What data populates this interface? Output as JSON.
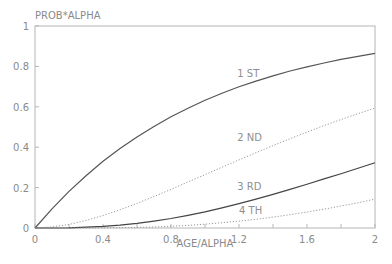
{
  "chart_data": {
    "type": "line",
    "title": "",
    "xlabel": "AGE/ALPHA",
    "ylabel": "PROB*ALPHA",
    "xlim": [
      0,
      2
    ],
    "ylim": [
      0,
      1
    ],
    "grid": false,
    "legend": "inline curve labels",
    "x_ticks": [
      "0",
      "0.4",
      "0.8",
      "1.2",
      "1.6",
      "2"
    ],
    "y_ticks": [
      "0",
      "0.2",
      "0.4",
      "0.6",
      "0.8",
      "1"
    ],
    "x": [
      0,
      0.1,
      0.2,
      0.3,
      0.4,
      0.5,
      0.6,
      0.7,
      0.8,
      0.9,
      1.0,
      1.1,
      1.2,
      1.3,
      1.4,
      1.5,
      1.6,
      1.7,
      1.8,
      1.9,
      2.0
    ],
    "series": [
      {
        "name": "1 ST",
        "style": "solid",
        "color": "#555555",
        "values": [
          0,
          0.095,
          0.181,
          0.259,
          0.33,
          0.393,
          0.451,
          0.503,
          0.551,
          0.593,
          0.632,
          0.667,
          0.699,
          0.727,
          0.753,
          0.777,
          0.798,
          0.817,
          0.835,
          0.85,
          0.865
        ],
        "label_pos": [
          1.19,
          0.75
        ]
      },
      {
        "name": "2 ND",
        "style": "dotted",
        "color": "#9a9a9a",
        "values": [
          0,
          0.005,
          0.018,
          0.037,
          0.062,
          0.09,
          0.122,
          0.156,
          0.191,
          0.228,
          0.264,
          0.301,
          0.337,
          0.373,
          0.408,
          0.442,
          0.475,
          0.507,
          0.537,
          0.566,
          0.594
        ],
        "label_pos": [
          1.19,
          0.43
        ]
      },
      {
        "name": "3 RD",
        "style": "solid",
        "color": "#444444",
        "values": [
          0,
          0.0,
          0.001,
          0.004,
          0.008,
          0.014,
          0.023,
          0.034,
          0.047,
          0.063,
          0.08,
          0.1,
          0.121,
          0.143,
          0.167,
          0.191,
          0.217,
          0.243,
          0.269,
          0.296,
          0.323
        ],
        "label_pos": [
          1.19,
          0.19
        ]
      },
      {
        "name": "4 TH",
        "style": "dotted",
        "color": "#9a9a9a",
        "values": [
          0,
          0.0,
          0.0,
          0.0,
          0.001,
          0.002,
          0.003,
          0.005,
          0.009,
          0.013,
          0.019,
          0.026,
          0.034,
          0.043,
          0.054,
          0.066,
          0.079,
          0.093,
          0.109,
          0.125,
          0.143
        ],
        "label_pos": [
          1.2,
          0.07
        ]
      }
    ]
  },
  "colors": {
    "axis": "#b5b5b5",
    "text": "#8a8a8a"
  }
}
